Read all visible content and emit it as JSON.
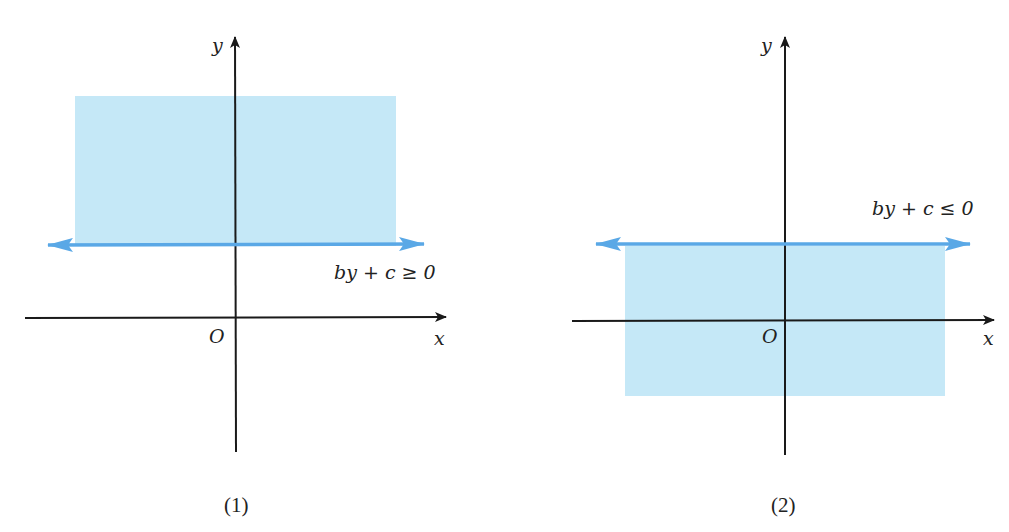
{
  "colors": {
    "region_fill": "#c5e8f7",
    "boundary_line": "#5aa8e6",
    "axis": "#1a1a1a"
  },
  "panels": [
    {
      "caption": "(1)",
      "axis_labels": {
        "x": "x",
        "y": "y",
        "origin": "O"
      },
      "inequality": "by + c ≥ 0",
      "shaded_side": "above boundary line"
    },
    {
      "caption": "(2)",
      "axis_labels": {
        "x": "x",
        "y": "y",
        "origin": "O"
      },
      "inequality": "by + c ≤ 0",
      "shaded_side": "below boundary line"
    }
  ]
}
